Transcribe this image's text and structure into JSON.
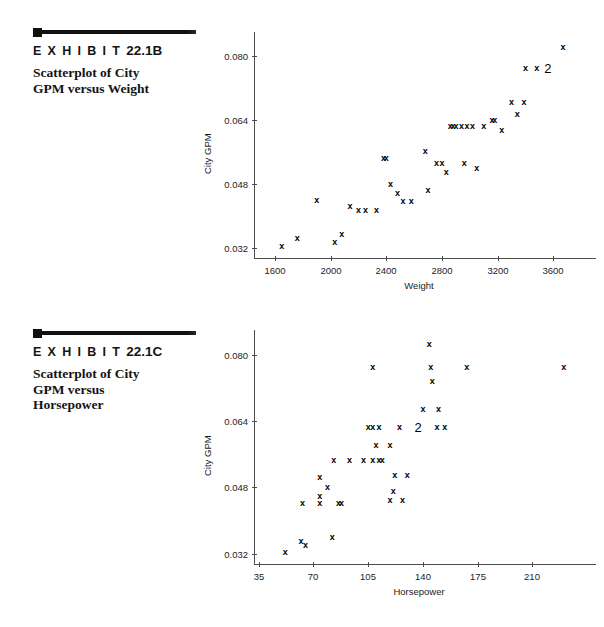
{
  "exhibits": [
    {
      "id": "22.1B",
      "title_word": "E X H I B I T",
      "number": "22.1B",
      "subtitle": "Scatterplot of City\nGPM versus Weight"
    },
    {
      "id": "22.1C",
      "title_word": "E X H I B I T",
      "number": "22.1C",
      "subtitle": "Scatterplot of City\nGPM versus\nHorsepower"
    }
  ],
  "chart_data": [
    {
      "type": "scatter",
      "title": "Scatterplot of City GPM versus Weight",
      "xlabel": "Weight",
      "ylabel": "City GPM",
      "xticks": [
        1600,
        2000,
        2400,
        2800,
        3200,
        3600
      ],
      "yticks": [
        0.032,
        0.048,
        0.064,
        0.08
      ],
      "xlim": [
        1450,
        3820
      ],
      "ylim": [
        0.0295,
        0.0845
      ],
      "grid": false,
      "legend": false,
      "marker": "x",
      "points": [
        {
          "x": 1650,
          "y": 0.0325,
          "label": "x"
        },
        {
          "x": 1760,
          "y": 0.0345,
          "label": "x"
        },
        {
          "x": 1900,
          "y": 0.044,
          "label": "x"
        },
        {
          "x": 2030,
          "y": 0.0336,
          "label": "x"
        },
        {
          "x": 2080,
          "y": 0.0355,
          "label": "x"
        },
        {
          "x": 2140,
          "y": 0.0424,
          "label": "x"
        },
        {
          "x": 2200,
          "y": 0.0415,
          "label": "x"
        },
        {
          "x": 2250,
          "y": 0.0415,
          "label": "x"
        },
        {
          "x": 2330,
          "y": 0.0415,
          "label": "x"
        },
        {
          "x": 2380,
          "y": 0.0545,
          "label": "x"
        },
        {
          "x": 2400,
          "y": 0.0545,
          "label": "x"
        },
        {
          "x": 2430,
          "y": 0.048,
          "label": "x"
        },
        {
          "x": 2480,
          "y": 0.0457,
          "label": "x"
        },
        {
          "x": 2520,
          "y": 0.0437,
          "label": "x"
        },
        {
          "x": 2580,
          "y": 0.0437,
          "label": "x"
        },
        {
          "x": 2680,
          "y": 0.0562,
          "label": "x"
        },
        {
          "x": 2700,
          "y": 0.0466,
          "label": "x"
        },
        {
          "x": 2760,
          "y": 0.0533,
          "label": "x"
        },
        {
          "x": 2800,
          "y": 0.0533,
          "label": "x"
        },
        {
          "x": 2830,
          "y": 0.051,
          "label": "x"
        },
        {
          "x": 2860,
          "y": 0.0625,
          "label": "x"
        },
        {
          "x": 2880,
          "y": 0.0625,
          "label": "x"
        },
        {
          "x": 2900,
          "y": 0.0625,
          "label": "x"
        },
        {
          "x": 2940,
          "y": 0.0625,
          "label": "x"
        },
        {
          "x": 2980,
          "y": 0.0625,
          "label": "x"
        },
        {
          "x": 3020,
          "y": 0.0625,
          "label": "x"
        },
        {
          "x": 2960,
          "y": 0.0533,
          "label": "x"
        },
        {
          "x": 3050,
          "y": 0.052,
          "label": "x"
        },
        {
          "x": 3100,
          "y": 0.0625,
          "label": "x"
        },
        {
          "x": 3160,
          "y": 0.064,
          "label": "x"
        },
        {
          "x": 3180,
          "y": 0.064,
          "label": "x"
        },
        {
          "x": 3230,
          "y": 0.0616,
          "label": "x"
        },
        {
          "x": 3300,
          "y": 0.0686,
          "label": "x"
        },
        {
          "x": 3340,
          "y": 0.0656,
          "label": "x"
        },
        {
          "x": 3390,
          "y": 0.0686,
          "label": "x"
        },
        {
          "x": 3400,
          "y": 0.077,
          "label": "x"
        },
        {
          "x": 3480,
          "y": 0.077,
          "label": "x"
        },
        {
          "x": 3560,
          "y": 0.077,
          "label": "2"
        },
        {
          "x": 3670,
          "y": 0.0822,
          "label": "x"
        }
      ]
    },
    {
      "type": "scatter",
      "title": "Scatterplot of City GPM versus Horsepower",
      "xlabel": "Horsepower",
      "ylabel": "City GPM",
      "xticks": [
        35,
        70,
        105,
        140,
        175,
        210
      ],
      "yticks": [
        0.032,
        0.048,
        0.064,
        0.08
      ],
      "xlim": [
        32,
        243
      ],
      "ylim": [
        0.0295,
        0.0845
      ],
      "grid": false,
      "legend": false,
      "marker": "x",
      "points": [
        {
          "x": 52,
          "y": 0.0325,
          "label": "x"
        },
        {
          "x": 62,
          "y": 0.035,
          "label": "x"
        },
        {
          "x": 65,
          "y": 0.034,
          "label": "x"
        },
        {
          "x": 63,
          "y": 0.0443,
          "label": "x"
        },
        {
          "x": 82,
          "y": 0.036,
          "label": "x"
        },
        {
          "x": 74,
          "y": 0.046,
          "label": "x"
        },
        {
          "x": 74,
          "y": 0.0442,
          "label": "x"
        },
        {
          "x": 79,
          "y": 0.048,
          "label": "x"
        },
        {
          "x": 74,
          "y": 0.0506,
          "label": "x"
        },
        {
          "x": 86,
          "y": 0.0442,
          "label": "x"
        },
        {
          "x": 88,
          "y": 0.0442,
          "label": "x"
        },
        {
          "x": 83,
          "y": 0.0546,
          "label": "x"
        },
        {
          "x": 93,
          "y": 0.0546,
          "label": "x"
        },
        {
          "x": 102,
          "y": 0.0546,
          "label": "x"
        },
        {
          "x": 108,
          "y": 0.0546,
          "label": "x"
        },
        {
          "x": 112,
          "y": 0.0546,
          "label": "x"
        },
        {
          "x": 114,
          "y": 0.0546,
          "label": "x"
        },
        {
          "x": 110,
          "y": 0.0582,
          "label": "x"
        },
        {
          "x": 105,
          "y": 0.0625,
          "label": "x"
        },
        {
          "x": 108,
          "y": 0.0625,
          "label": "x"
        },
        {
          "x": 112,
          "y": 0.0625,
          "label": "x"
        },
        {
          "x": 125,
          "y": 0.0625,
          "label": "x"
        },
        {
          "x": 137,
          "y": 0.0625,
          "label": "2"
        },
        {
          "x": 119,
          "y": 0.0582,
          "label": "x"
        },
        {
          "x": 122,
          "y": 0.051,
          "label": "x"
        },
        {
          "x": 130,
          "y": 0.051,
          "label": "x"
        },
        {
          "x": 121,
          "y": 0.047,
          "label": "x"
        },
        {
          "x": 119,
          "y": 0.045,
          "label": "x"
        },
        {
          "x": 127,
          "y": 0.045,
          "label": "x"
        },
        {
          "x": 149,
          "y": 0.0625,
          "label": "x"
        },
        {
          "x": 154,
          "y": 0.0625,
          "label": "x"
        },
        {
          "x": 150,
          "y": 0.067,
          "label": "x"
        },
        {
          "x": 140,
          "y": 0.067,
          "label": "x"
        },
        {
          "x": 146,
          "y": 0.0736,
          "label": "x"
        },
        {
          "x": 144,
          "y": 0.0826,
          "label": "x"
        },
        {
          "x": 108,
          "y": 0.077,
          "label": "x"
        },
        {
          "x": 145,
          "y": 0.077,
          "label": "x"
        },
        {
          "x": 168,
          "y": 0.077,
          "label": "x"
        },
        {
          "x": 230,
          "y": 0.077,
          "label": "x"
        }
      ]
    }
  ]
}
